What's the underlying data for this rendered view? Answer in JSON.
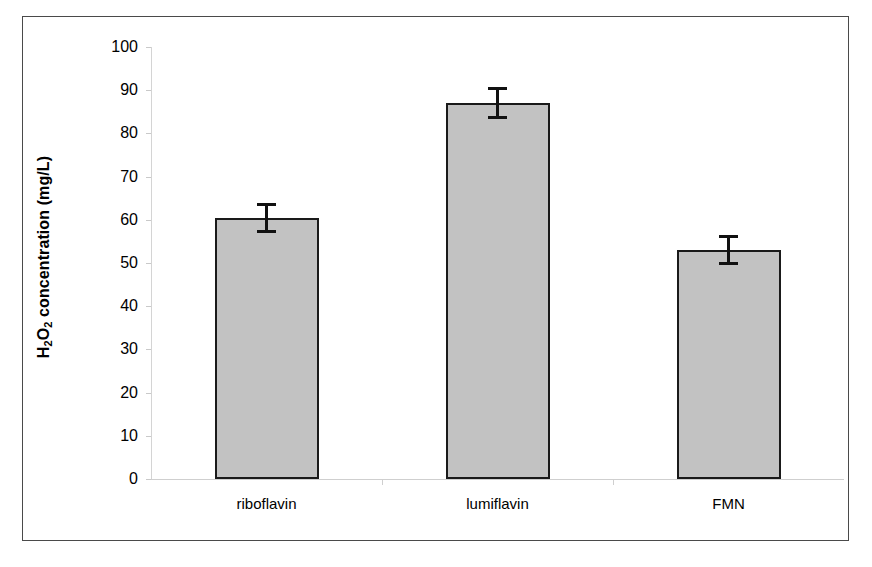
{
  "chart_data": {
    "type": "bar",
    "title": "",
    "xlabel": "",
    "ylabel": "H2O2 concentration (mg/L)",
    "ylabel_parts": {
      "h": "H",
      "sub1": "2",
      "o": "O",
      "sub2": "2",
      "rest": " concentration (mg/L)"
    },
    "categories": [
      "riboflavin",
      "lumiflavin",
      "FMN"
    ],
    "values": [
      60.5,
      87.0,
      53.0
    ],
    "errors": [
      3.5,
      3.7,
      3.5
    ],
    "ylim": [
      0,
      100
    ],
    "yticks": [
      0,
      10,
      20,
      30,
      40,
      50,
      60,
      70,
      80,
      90,
      100
    ],
    "ytick_labels": [
      "0",
      "10",
      "20",
      "30",
      "40",
      "50",
      "60",
      "70",
      "80",
      "90",
      "100"
    ],
    "grid": false,
    "legend": null,
    "bar_fill_color": "#c2c2c2",
    "bar_edge_color": "#1a1a1a",
    "error_bar_color": "#111111",
    "axis_color": "#cfcfcf",
    "frame_color": "#4a4a4a",
    "background_color": "#ffffff",
    "error_bar_style": "symmetric-caps"
  }
}
